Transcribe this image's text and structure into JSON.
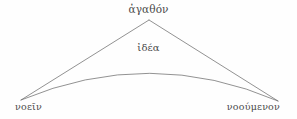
{
  "figure": {
    "kind": "geometric-diagram",
    "background_color": "#fefefe",
    "stroke_color": "#6e6e6e",
    "text_color": "#4a4a4a",
    "labels": {
      "apex": "ἀγαθόν",
      "interior": "ἰδέα",
      "bottom_left": "νοεῖν",
      "bottom_right": "νοούμενον"
    },
    "geometry": {
      "apex_point": "149,20",
      "left_vertex": "21,100",
      "right_vertex": "278,101",
      "arc_control_point": "150,46"
    }
  }
}
